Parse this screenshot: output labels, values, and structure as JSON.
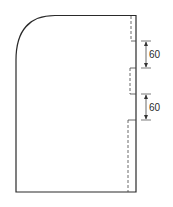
{
  "diagram": {
    "type": "pattern-piece-outline",
    "colors": {
      "stroke": "#2a2a2a",
      "background": "#ffffff"
    },
    "dimensions": [
      {
        "label": "60",
        "position": "upper"
      },
      {
        "label": "60",
        "position": "lower"
      }
    ]
  }
}
